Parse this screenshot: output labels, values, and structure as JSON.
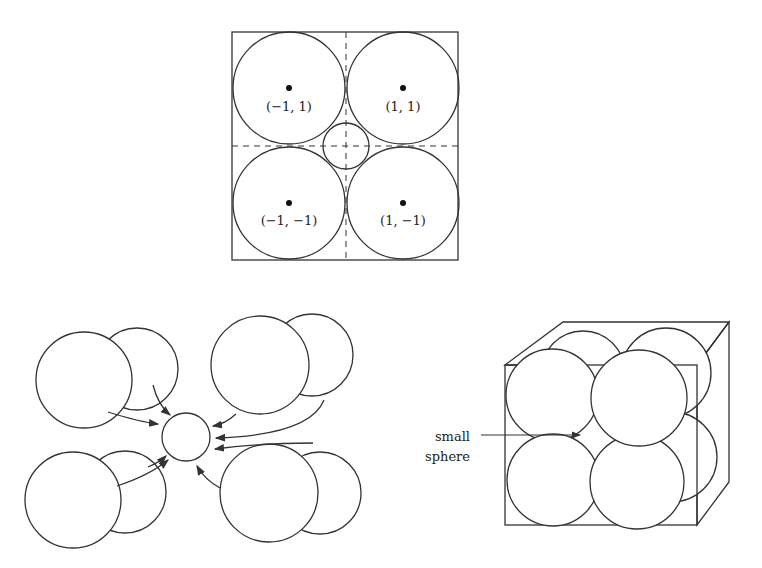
{
  "top_diagram": {
    "labels": [
      "(−1, 1)",
      "(1, 1)",
      "(−1, −1)",
      "(1, −1)"
    ]
  },
  "right_diagram": {
    "label_line1": "small",
    "label_line2": "sphere"
  }
}
